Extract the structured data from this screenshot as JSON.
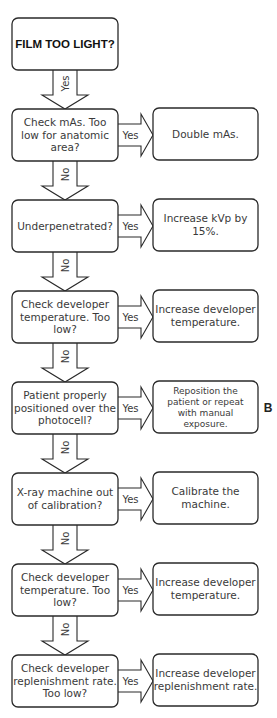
{
  "start": {
    "label": "FILM TOO LIGHT?",
    "yes_label": "Yes"
  },
  "panel_letter": "B",
  "steps": [
    {
      "question": [
        "Check mAs. Too",
        "low for anatomic",
        "area?"
      ],
      "yes_label": "Yes",
      "action": [
        "Double mAs."
      ],
      "no_label": "No"
    },
    {
      "question": [
        "Underpenetrated?"
      ],
      "yes_label": "Yes",
      "action": [
        "Increase kVp by",
        "15%."
      ],
      "no_label": "No"
    },
    {
      "question": [
        "Check developer",
        "temperature. Too",
        "low?"
      ],
      "yes_label": "Yes",
      "action": [
        "Increase developer",
        "temperature."
      ],
      "no_label": "No"
    },
    {
      "question": [
        "Patient properly",
        "positioned over the",
        "photocell?"
      ],
      "yes_label": "Yes",
      "action": [
        "Reposition the",
        "patient or repeat",
        "with manual",
        "exposure."
      ],
      "no_label": "No"
    },
    {
      "question": [
        "X-ray machine out",
        "of calibration?"
      ],
      "yes_label": "Yes",
      "action": [
        "Calibrate the",
        "machine."
      ],
      "no_label": "No"
    },
    {
      "question": [
        "Check developer",
        "temperature. Too",
        "low?"
      ],
      "yes_label": "Yes",
      "action": [
        "Increase developer",
        "temperature."
      ],
      "no_label": "No"
    },
    {
      "question": [
        "Check developer",
        "replenishment rate.",
        "Too low?"
      ],
      "yes_label": "Yes",
      "action": [
        "Increase developer",
        "replenishment rate."
      ],
      "no_label": null
    }
  ]
}
